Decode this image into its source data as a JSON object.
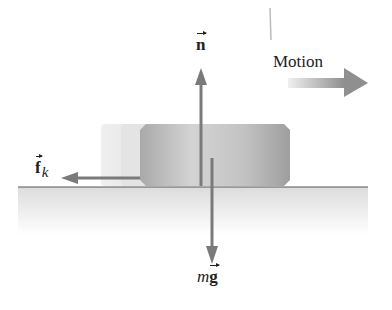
{
  "diagram": {
    "type": "free-body diagram",
    "labels": {
      "normal_force": "n",
      "motion": "Motion",
      "friction_force": "f",
      "friction_subscript": "k",
      "weight_mass": "m",
      "weight_g": "g"
    },
    "forces": [
      {
        "name": "normal force",
        "symbol": "n",
        "direction": "up"
      },
      {
        "name": "kinetic friction",
        "symbol": "f_k",
        "direction": "left"
      },
      {
        "name": "weight",
        "symbol": "mg",
        "direction": "down"
      }
    ],
    "motion_direction": "right",
    "colors": {
      "arrow": "#7a7a7a",
      "block": "#b8b8b8",
      "ground_line": "#555555",
      "ground_fill": "#e6e6e6",
      "text": "#222222"
    }
  }
}
